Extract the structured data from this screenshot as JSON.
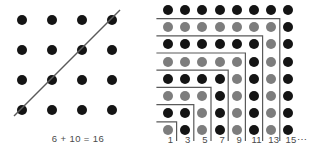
{
  "figure": {
    "background_color": "#ffffff",
    "dot_dark_color": "#141414",
    "dot_gray_color": "#7d7d7d",
    "line_color": "#5a5a5a",
    "text_color": "#4a4a4a"
  },
  "left_panel": {
    "name": "square-split-by-diagonal",
    "caption": "6 + 10 = 16",
    "grid": {
      "rows": 4,
      "cols": 4,
      "dot_radius": 5,
      "spacing": 30,
      "origin_x": 22,
      "origin_y": 20,
      "dot_color_all": "#141414"
    },
    "diagonal": {
      "name": "diagonal-cut-line",
      "x1": 14,
      "y1": 116,
      "x2": 120,
      "y2": 10,
      "stroke_width": 1.4
    },
    "chart_data": {
      "type": "scatter",
      "title": "6 + 10 = 16",
      "description": "4 by 4 array of 16 dots cut by a diagonal line into 6 dots above-left and 10 dots below-right",
      "total_dots": 16,
      "part_a": 6,
      "part_b": 10,
      "sum": 16,
      "grid_rows": 4,
      "grid_cols": 4
    }
  },
  "right_panel": {
    "name": "odd-number-gnomons-square",
    "grid": {
      "rows": 8,
      "cols": 8,
      "dot_radius": 5,
      "spacing": 17.2,
      "origin_x": 12,
      "origin_y": 10
    },
    "axis_labels": [
      "1",
      "3",
      "5",
      "7",
      "9",
      "11",
      "13",
      "15"
    ],
    "axis_ellipsis": "⋯",
    "row_colors": [
      [
        "dark",
        "dark",
        "dark",
        "dark",
        "dark",
        "dark",
        "dark",
        "dark"
      ],
      [
        "gray",
        "gray",
        "gray",
        "gray",
        "gray",
        "gray",
        "gray",
        "dark"
      ],
      [
        "dark",
        "dark",
        "dark",
        "dark",
        "dark",
        "dark",
        "gray",
        "dark"
      ],
      [
        "gray",
        "gray",
        "gray",
        "gray",
        "gray",
        "dark",
        "gray",
        "dark"
      ],
      [
        "dark",
        "dark",
        "dark",
        "dark",
        "gray",
        "dark",
        "gray",
        "dark"
      ],
      [
        "gray",
        "gray",
        "gray",
        "dark",
        "gray",
        "dark",
        "gray",
        "dark"
      ],
      [
        "dark",
        "dark",
        "gray",
        "dark",
        "gray",
        "dark",
        "gray",
        "dark"
      ],
      [
        "gray",
        "dark",
        "gray",
        "dark",
        "gray",
        "dark",
        "gray",
        "dark"
      ]
    ],
    "gnomons": [
      {
        "name": "gnomon-1",
        "size": 1,
        "odd_value": 1
      },
      {
        "name": "gnomon-3",
        "size": 2,
        "odd_value": 3
      },
      {
        "name": "gnomon-5",
        "size": 3,
        "odd_value": 5
      },
      {
        "name": "gnomon-7",
        "size": 4,
        "odd_value": 7
      },
      {
        "name": "gnomon-9",
        "size": 5,
        "odd_value": 9
      },
      {
        "name": "gnomon-11",
        "size": 6,
        "odd_value": 11
      },
      {
        "name": "gnomon-13",
        "size": 7,
        "odd_value": 13
      },
      {
        "name": "gnomon-15",
        "size": 8,
        "odd_value": 15
      }
    ],
    "chart_data": {
      "type": "scatter",
      "title": "Sum of consecutive odd numbers forms a square",
      "description": "8 by 8 array of 64 dots partitioned by nested L-shaped gnomon outlines; each gnomon contains an odd number of dots",
      "categories": [
        "1",
        "3",
        "5",
        "7",
        "9",
        "11",
        "13",
        "15"
      ],
      "values": [
        1,
        3,
        5,
        7,
        9,
        11,
        13,
        15
      ],
      "cumulative_sums": [
        1,
        4,
        9,
        16,
        25,
        36,
        49,
        64
      ],
      "xlabel": "",
      "ylabel": "",
      "grid_rows": 8,
      "grid_cols": 8,
      "total_dots": 64
    }
  }
}
